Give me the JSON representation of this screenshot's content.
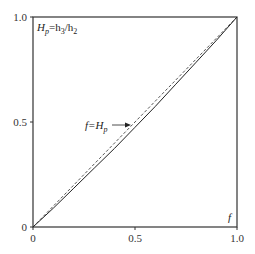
{
  "chart_data": {
    "type": "line",
    "title": "",
    "xlabel": "f",
    "ylabel": "H_p = h_3/h_2",
    "xlim": [
      0,
      1.0
    ],
    "ylim": [
      0,
      1.0
    ],
    "grid": false,
    "legend": null,
    "x_ticks": [
      "0",
      "0.5",
      "1.0"
    ],
    "y_ticks": [
      "0",
      "0.5",
      "1.0"
    ],
    "series": [
      {
        "name": "H_p",
        "style": "solid",
        "x": [
          0,
          0.1,
          0.2,
          0.3,
          0.4,
          0.5,
          0.6,
          0.7,
          0.8,
          0.9,
          1.0
        ],
        "y": [
          0,
          0.09,
          0.185,
          0.28,
          0.375,
          0.475,
          0.575,
          0.68,
          0.785,
          0.89,
          1.0
        ]
      },
      {
        "name": "f = H_p",
        "style": "dashed",
        "x": [
          0,
          1.0
        ],
        "y": [
          0,
          1.0
        ]
      }
    ],
    "annotations": [
      {
        "text": "f=H_p",
        "arrow_to": [
          0.49,
          0.475
        ]
      },
      {
        "text": "H_p=h_3/h_2",
        "position": "top-left inside"
      },
      {
        "text": "f",
        "position": "bottom-right inside"
      }
    ]
  },
  "labels": {
    "ylabel_main": "H",
    "ylabel_sub": "p",
    "ylabel_eq": "=h",
    "ylabel_sub3": "3",
    "ylabel_slash": "/h",
    "ylabel_sub2": "2",
    "xlabel": "f",
    "ann_f": "f=H",
    "ann_sub": "p",
    "xt0": "0",
    "xt1": "0.5",
    "xt2": "1.0",
    "yt0": "0",
    "yt1": "0.5",
    "yt2": "1.0"
  }
}
